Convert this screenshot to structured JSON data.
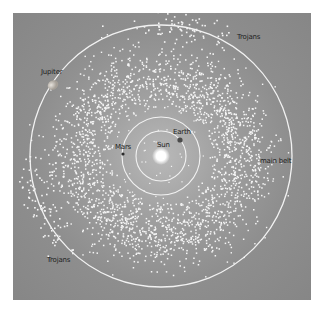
{
  "diagram": {
    "colors": {
      "background": "#8c8c8c",
      "orbit": "#f2f2f2",
      "asteroid": "#f5f5f5",
      "sun": "#ffffff",
      "label": "#1e1e1e"
    },
    "bodies": {
      "sun": {
        "label": "Sun"
      },
      "earth": {
        "label": "Earth"
      },
      "mars": {
        "label": "Mars"
      },
      "jupiter": {
        "label": "Jupiter"
      }
    },
    "groups": {
      "main_belt": {
        "label": "main belt"
      },
      "trojans_leading": {
        "label": "Trojans"
      },
      "trojans_trailing": {
        "label": "Trojans"
      }
    }
  }
}
